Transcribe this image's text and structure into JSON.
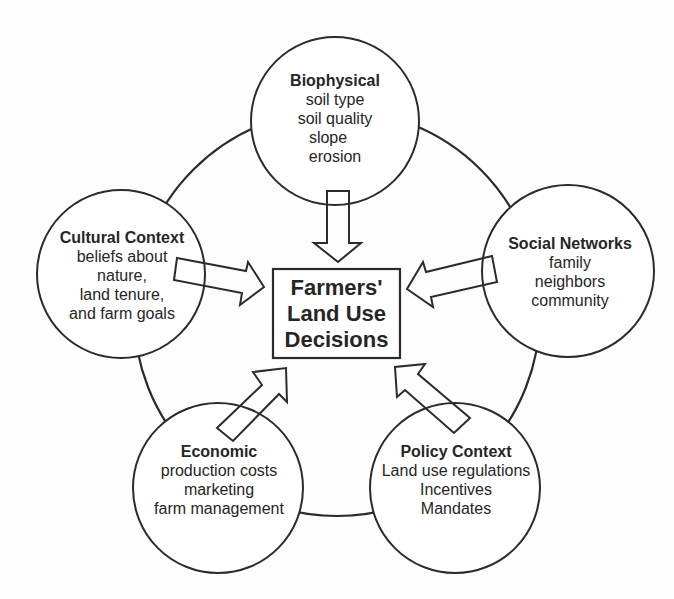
{
  "diagram": {
    "center": {
      "lines": [
        "Farmers'",
        "Land Use",
        "Decisions"
      ]
    },
    "nodes": [
      {
        "id": "biophysical",
        "title": "Biophysical",
        "items": [
          "soil type",
          "soil quality",
          "slope",
          "erosion"
        ]
      },
      {
        "id": "social-networks",
        "title": "Social Networks",
        "items": [
          "family",
          "neighbors",
          "community"
        ]
      },
      {
        "id": "policy-context",
        "title": "Policy Context",
        "items": [
          "Land use regulations",
          "Incentives",
          "Mandates"
        ]
      },
      {
        "id": "economic",
        "title": "Economic",
        "items": [
          "production costs",
          "marketing",
          "farm management"
        ]
      },
      {
        "id": "cultural-context",
        "title": "Cultural Context",
        "items": [
          "beliefs about",
          "nature,",
          "land tenure,",
          "and farm goals"
        ]
      }
    ],
    "colors": {
      "stroke": "#2b2b2b",
      "fill": "#ffffff",
      "text": "#262626",
      "background": "#fdfdfd"
    }
  }
}
